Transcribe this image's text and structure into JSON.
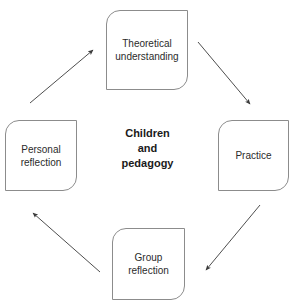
{
  "diagram": {
    "title": "Children\nand\npedagogy",
    "center_label": "Children and pedagogy",
    "cycle_direction": "clockwise",
    "stroke_color": "#8c8c8c",
    "arrow_color": "#3a3a3a",
    "text_color": "#2b2b2b",
    "background": "#ffffff",
    "nodes": [
      {
        "id": "theoretical-understanding",
        "label": "Theoretical\nunderstanding",
        "position": "top"
      },
      {
        "id": "practice",
        "label": "Practice",
        "position": "right"
      },
      {
        "id": "group-reflection",
        "label": "Group\nreflection",
        "position": "bottom"
      },
      {
        "id": "personal-reflection",
        "label": "Personal\nreflection",
        "position": "left"
      }
    ],
    "arrows": [
      {
        "id": "arrow-theoretical-to-practice",
        "from": "theoretical-understanding",
        "to": "practice"
      },
      {
        "id": "arrow-practice-to-group",
        "from": "practice",
        "to": "group-reflection"
      },
      {
        "id": "arrow-group-to-personal",
        "from": "group-reflection",
        "to": "personal-reflection"
      },
      {
        "id": "arrow-personal-to-theoretical",
        "from": "personal-reflection",
        "to": "theoretical-understanding"
      }
    ]
  }
}
